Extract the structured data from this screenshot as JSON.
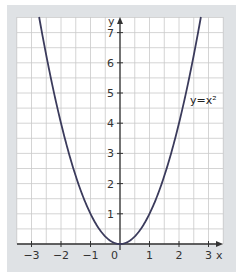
{
  "chart_data": {
    "type": "line",
    "title": "",
    "function": "y = x^2",
    "xlabel": "x",
    "ylabel": "y",
    "xlim": [
      -3.5,
      3.5
    ],
    "ylim": [
      0,
      7.5
    ],
    "x_ticks": [
      -3,
      -2,
      -1,
      0,
      1,
      2,
      3
    ],
    "y_ticks": [
      1,
      2,
      3,
      4,
      5,
      6,
      7
    ],
    "grid": true,
    "grid_step": 0.5,
    "series": [
      {
        "name": "y=x²",
        "x": [
          -2.7,
          -2.5,
          -2,
          -1.5,
          -1,
          -0.5,
          0,
          0.5,
          1,
          1.5,
          2,
          2.5,
          2.7
        ],
        "values": [
          7.29,
          6.25,
          4,
          2.25,
          1,
          0.25,
          0,
          0.25,
          1,
          2.25,
          4,
          6.25,
          7.29
        ]
      }
    ],
    "annotations": [
      {
        "text": "y=x²",
        "x": 2.3,
        "y": 4.8
      }
    ],
    "colors": {
      "panel": "#dfe2e5",
      "grid_bg": "#ffffff",
      "grid_line": "#c9c9c9",
      "curve": "#3b3b5c",
      "axis": "#333333"
    }
  },
  "labels": {
    "x_axis": "x",
    "y_axis": "y",
    "origin": "0",
    "curve": "y=x²"
  }
}
